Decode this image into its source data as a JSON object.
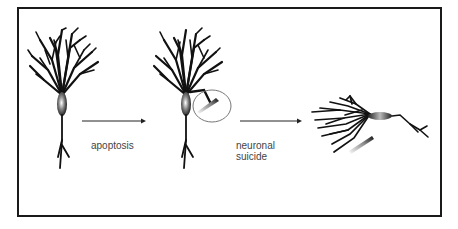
{
  "figure": {
    "panels": [
      {
        "id": "healthy-neuron",
        "description": "intact neuron with dendritic tree"
      },
      {
        "id": "targeted-neuron",
        "description": "neuron with circled injection/needle at soma"
      },
      {
        "id": "collapsed-neuron",
        "description": "fallen, dying neuron with needle nearby"
      }
    ],
    "arrows": [
      {
        "label": "apoptosis"
      },
      {
        "label_lines": [
          "neuronal",
          "suicide"
        ]
      }
    ]
  },
  "colors": {
    "frame": "#1a1a1a",
    "neuron": "#111111",
    "circle": "#777777",
    "text": "#444444"
  }
}
